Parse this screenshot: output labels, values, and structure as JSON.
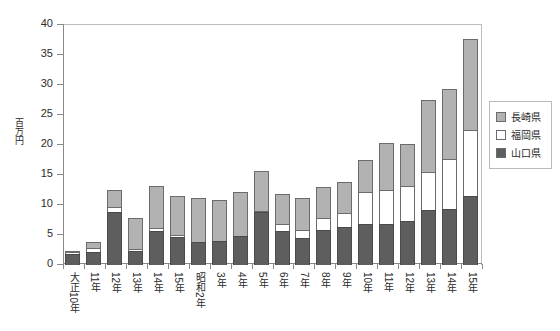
{
  "chart_data": {
    "type": "bar",
    "subtype": "stacked-bar",
    "title": "",
    "xlabel": "",
    "ylabel": "百万円",
    "ylim": [
      0,
      40
    ],
    "yticks": [
      0,
      5,
      10,
      15,
      20,
      25,
      30,
      35,
      40
    ],
    "grid": false,
    "legend_position": "right",
    "categories": [
      "大正10年",
      "11年",
      "12年",
      "13年",
      "14年",
      "15年",
      "昭和2年",
      "3年",
      "4年",
      "5年",
      "6年",
      "7年",
      "8年",
      "9年",
      "10年",
      "11年",
      "12年",
      "13年",
      "14年",
      "15年"
    ],
    "series": [
      {
        "name": "山口県",
        "color": "#5e5e5e",
        "values": [
          1.8,
          2.1,
          8.8,
          2.4,
          5.6,
          4.6,
          3.9,
          4.0,
          4.9,
          8.8,
          5.6,
          4.5,
          5.8,
          6.3,
          6.9,
          6.9,
          7.4,
          9.2,
          9.3,
          11.5
        ]
      },
      {
        "name": "福岡県",
        "color": "#ffffff",
        "values": [
          0.5,
          0.9,
          1.0,
          0.5,
          0.8,
          0.6,
          0.0,
          0.0,
          0.0,
          0.3,
          1.4,
          1.5,
          2.2,
          2.6,
          5.5,
          5.7,
          6.0,
          6.5,
          8.6,
          11.1
        ]
      },
      {
        "name": "長崎県",
        "color": "#b2b2b2",
        "values": [
          0.4,
          1.2,
          3.1,
          5.3,
          7.1,
          6.7,
          7.5,
          7.0,
          7.4,
          6.9,
          5.2,
          5.5,
          5.4,
          5.3,
          5.4,
          8.0,
          7.1,
          12.2,
          11.7,
          15.4
        ]
      }
    ],
    "totals": [
      2.7,
      4.2,
      12.9,
      8.2,
      13.5,
      11.9,
      11.4,
      11.0,
      12.3,
      16.0,
      12.2,
      11.5,
      13.4,
      14.2,
      17.8,
      20.6,
      20.5,
      27.9,
      29.6,
      38.0
    ]
  },
  "legend": {
    "items": [
      {
        "label": "長崎県",
        "swatch": "nagasaki"
      },
      {
        "label": "福岡県",
        "swatch": "fukuoka"
      },
      {
        "label": "山口県",
        "swatch": "yamaguchi"
      }
    ]
  },
  "colors": {
    "nagasaki": "#b2b2b2",
    "fukuoka": "#ffffff",
    "yamaguchi": "#5e5e5e",
    "axis": "#8a8a8a",
    "text": "#2b2b2b",
    "background": "#ffffff"
  }
}
